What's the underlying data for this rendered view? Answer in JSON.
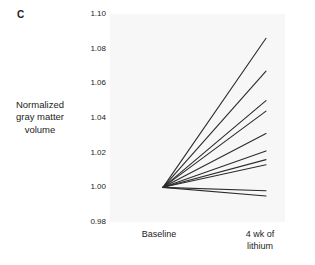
{
  "panel": {
    "label": "C"
  },
  "axes": {
    "y_title_lines": [
      "Normalized",
      "gray matter",
      "volume"
    ],
    "y_ticks": [
      "1.10",
      "1.08",
      "1.06",
      "1.04",
      "1.02",
      "1.00",
      "0.98"
    ],
    "x_tick_left_lines": [
      "Baseline"
    ],
    "x_tick_right_lines": [
      "4 wk of",
      "lithium"
    ]
  },
  "style": {
    "line_color": "#2b2b2b",
    "panel_background": "#f7f7f7",
    "figure_background": "#ffffff",
    "text_color": "#1c1c1c"
  },
  "chart_data": {
    "type": "line",
    "title": "",
    "subtitle": "",
    "panel_letter": "C",
    "xlabel": "",
    "ylabel": "Normalized gray matter volume",
    "categories": [
      "Baseline",
      "4 wk of lithium"
    ],
    "x": [
      0,
      1
    ],
    "ylim": [
      0.98,
      1.1
    ],
    "yticks": [
      0.98,
      1.0,
      1.02,
      1.04,
      1.06,
      1.08,
      1.1
    ],
    "ytick_labels": [
      "0.98",
      "1.00",
      "1.02",
      "1.04",
      "1.06",
      "1.08",
      "1.10"
    ],
    "grid": false,
    "legend": "none",
    "note": "Spaghetti plot: each line is one subject, all normalized to 1.00 at baseline.",
    "series": [
      {
        "name": "Subject 1",
        "values": [
          1.0,
          1.086
        ]
      },
      {
        "name": "Subject 2",
        "values": [
          1.0,
          1.067
        ]
      },
      {
        "name": "Subject 3",
        "values": [
          1.0,
          1.05
        ]
      },
      {
        "name": "Subject 4",
        "values": [
          1.0,
          1.044
        ]
      },
      {
        "name": "Subject 5",
        "values": [
          1.0,
          1.031
        ]
      },
      {
        "name": "Subject 6",
        "values": [
          1.0,
          1.021
        ]
      },
      {
        "name": "Subject 7",
        "values": [
          1.0,
          1.016
        ]
      },
      {
        "name": "Subject 8",
        "values": [
          1.0,
          1.013
        ]
      },
      {
        "name": "Subject 9",
        "values": [
          1.0,
          0.998
        ]
      },
      {
        "name": "Subject 10",
        "values": [
          1.0,
          0.995
        ]
      }
    ]
  }
}
